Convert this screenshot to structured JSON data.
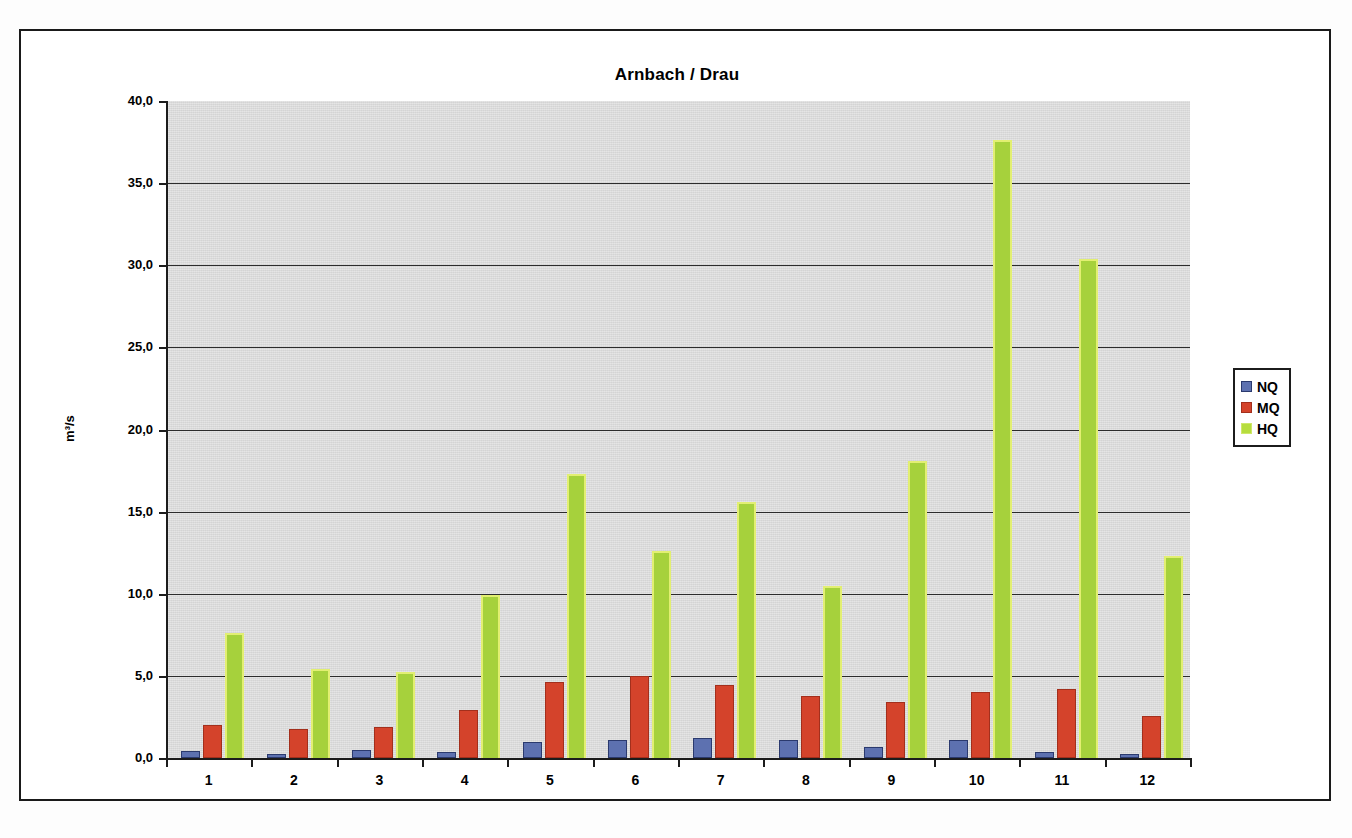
{
  "chart_data": {
    "type": "bar",
    "title": "Arnbach / Drau",
    "xlabel": "",
    "ylabel": "m³/s",
    "ylim": [
      0,
      40
    ],
    "ytick_labels": [
      "40,0",
      "35,0",
      "30,0",
      "25,0",
      "20,0",
      "15,0",
      "10,0",
      "5,0",
      "0,0"
    ],
    "ytick_values": [
      40,
      35,
      30,
      25,
      20,
      15,
      10,
      5,
      0
    ],
    "grid": true,
    "legend_position": "right",
    "categories": [
      "1",
      "2",
      "3",
      "4",
      "5",
      "6",
      "7",
      "8",
      "9",
      "10",
      "11",
      "12"
    ],
    "series": [
      {
        "name": "NQ",
        "color": "#5d71b0",
        "values": [
          0.4,
          0.25,
          0.5,
          0.35,
          0.95,
          1.1,
          1.2,
          1.1,
          0.7,
          1.1,
          0.35,
          0.25
        ]
      },
      {
        "name": "MQ",
        "color": "#d4432b",
        "values": [
          2.0,
          1.75,
          1.9,
          2.9,
          4.6,
          5.0,
          4.45,
          3.75,
          3.4,
          4.0,
          4.2,
          2.55
        ]
      },
      {
        "name": "HQ",
        "color": "#a6d13c",
        "values": [
          7.6,
          5.4,
          5.25,
          9.9,
          17.3,
          12.6,
          15.6,
          10.5,
          18.1,
          37.6,
          30.4,
          12.3
        ]
      }
    ]
  },
  "legend": {
    "items": [
      {
        "label": "NQ",
        "key": "nq"
      },
      {
        "label": "MQ",
        "key": "mq"
      },
      {
        "label": "HQ",
        "key": "hq"
      }
    ]
  }
}
